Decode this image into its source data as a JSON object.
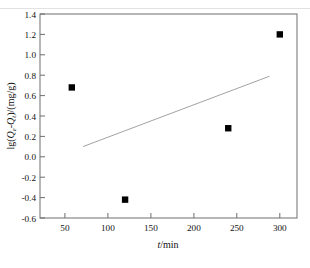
{
  "figure": {
    "background_color": "#ffffff",
    "frame_color": "#6e6e6e",
    "marker_color": "#000000",
    "line_color": "#8a8a8a",
    "caption_remnant": "",
    "plot_frame": {
      "left": 40,
      "top": 14,
      "right": 297,
      "bottom": 218
    }
  },
  "axes": {
    "x": {
      "title_main": "t",
      "title_unit": "/min",
      "tick_labels": [
        "50",
        "100",
        "150",
        "200",
        "250",
        "300"
      ],
      "tick_values": [
        50,
        100,
        150,
        200,
        250,
        300
      ],
      "min": 21,
      "max": 320
    },
    "y": {
      "title_prefix": "lg(",
      "title_q1": "Q",
      "title_q1_sub": "e",
      "title_dash": "-",
      "title_q2": "Q",
      "title_q2_sub": "t",
      "title_suffix": ")/(mg/g)",
      "tick_labels": [
        "1.4",
        "1.2",
        "1.0",
        "0.8",
        "0.6",
        "0.4",
        "0.2",
        "0.0",
        "-0.2",
        "-0.4",
        "-0.6"
      ],
      "tick_values": [
        1.4,
        1.2,
        1.0,
        0.8,
        0.6,
        0.4,
        0.2,
        0.0,
        -0.2,
        -0.4,
        -0.6
      ],
      "min": -0.6,
      "max": 1.4
    }
  },
  "chart_data": {
    "type": "scatter",
    "title": "",
    "xlabel": "t/min",
    "ylabel": "lg(Qe-Qt)/(mg/g)",
    "xlim": [
      21,
      320
    ],
    "ylim": [
      -0.6,
      1.4
    ],
    "grid": false,
    "legend": "none",
    "marker_style": "filled-square",
    "series": [
      {
        "name": "lg(Qe-Qt)",
        "x": [
          58,
          120,
          240,
          300
        ],
        "y": [
          0.68,
          -0.42,
          0.28,
          1.2
        ]
      }
    ],
    "fit_line": {
      "name": "linear fit",
      "x": [
        71,
        288
      ],
      "y": [
        0.1,
        0.79
      ],
      "style": "solid",
      "width": 0.8
    }
  }
}
